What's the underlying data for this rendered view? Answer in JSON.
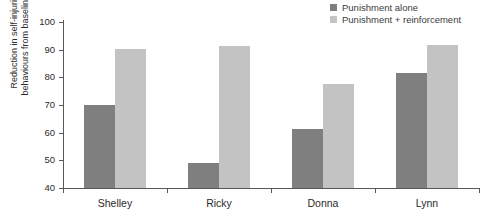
{
  "chart_data": {
    "type": "bar",
    "title": "",
    "xlabel": "",
    "ylabel": "Reduction in self-injurious\nbehaviours from baseline (%)",
    "categories": [
      "Shelley",
      "Ricky",
      "Donna",
      "Lynn"
    ],
    "yticks": [
      40,
      50,
      60,
      70,
      80,
      90,
      100
    ],
    "ylim": [
      40,
      100
    ],
    "grid": false,
    "legend_position": "top-right",
    "series": [
      {
        "name": "Punishment alone",
        "color": "#7f7f7f",
        "values": [
          70.0,
          49.2,
          61.3,
          81.6
        ]
      },
      {
        "name": "Punishment + reinforcement",
        "color": "#c3c3c3",
        "values": [
          90.1,
          91.4,
          77.5,
          91.8
        ]
      }
    ]
  },
  "legend": {
    "items": [
      {
        "label": "Punishment alone",
        "swatch": "#7f7f7f"
      },
      {
        "label": "Punishment + reinforcement",
        "swatch": "#c3c3c3"
      }
    ]
  },
  "axis": {
    "y_title": "Reduction in self-injurious\nbehaviours from baseline (%)",
    "y_tick_labels": [
      "100",
      "90",
      "80",
      "70",
      "60",
      "50",
      "40"
    ],
    "x_tick_labels": [
      "Shelley",
      "Ricky",
      "Donna",
      "Lynn"
    ]
  }
}
